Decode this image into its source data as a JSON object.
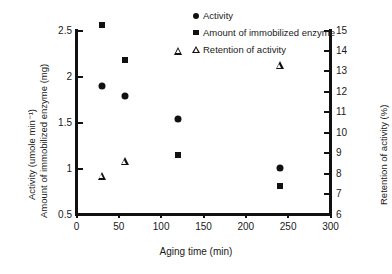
{
  "chart_data": {
    "type": "scatter",
    "title": "",
    "xlabel": "Aging time (min)",
    "ylabel_left_line1": "Activity (umole min⁻¹)",
    "ylabel_left_line2": "Amount of immobilized enzyme (mg)",
    "ylabel_right": "Retention of activity (%)",
    "xlim": [
      0,
      300
    ],
    "ylim_left": [
      0.5,
      2.5
    ],
    "ylim_right": [
      6,
      15
    ],
    "xticks": [
      0,
      50,
      100,
      150,
      200,
      250,
      300
    ],
    "xtick_labels": [
      "0",
      "50",
      "100",
      "150",
      "200",
      "250",
      "300"
    ],
    "yticks_left": [
      0.5,
      1,
      1.5,
      2,
      2.5
    ],
    "ytick_labels_left": [
      "0.5",
      "1",
      "1.5",
      "2",
      "2.5"
    ],
    "yticks_right": [
      6,
      7,
      8,
      9,
      10,
      11,
      12,
      13,
      14,
      15
    ],
    "ytick_labels_right": [
      "6",
      "7",
      "8",
      "9",
      "10",
      "11",
      "12",
      "13",
      "14",
      "15"
    ],
    "grid": false,
    "legend_position": "top-center",
    "marker_color": "#111111",
    "series": [
      {
        "name": "Activity",
        "marker": "filled-circle",
        "axis": "left",
        "x": [
          30,
          57,
          120,
          240
        ],
        "values": [
          1.9,
          1.79,
          1.54,
          1.01
        ]
      },
      {
        "name": "Amount of immobilized enzyme",
        "marker": "filled-square",
        "axis": "left",
        "x": [
          30,
          57,
          120,
          240
        ],
        "values": [
          2.56,
          2.18,
          1.15,
          0.81
        ]
      },
      {
        "name": "Retention of activity",
        "marker": "open-triangle",
        "axis": "right",
        "x": [
          30,
          57,
          120,
          240
        ],
        "values": [
          7.9,
          8.6,
          14.0,
          13.3
        ]
      }
    ]
  },
  "legend": {
    "items": [
      {
        "label": "Activity",
        "marker": "filled-circle"
      },
      {
        "label": "Amount of immobilized enzyme",
        "marker": "filled-square"
      },
      {
        "label": "Retention of activity",
        "marker": "open-triangle"
      }
    ]
  }
}
